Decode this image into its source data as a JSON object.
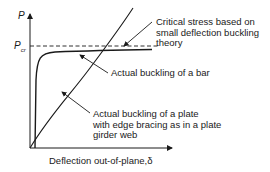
{
  "axes": {
    "y_label": "P",
    "y_marker_main": "P",
    "y_marker_sub": "cr",
    "x_label": "Deflection out-of-plane,δ"
  },
  "annotations": {
    "critical": [
      "Critical stress based on",
      "small deflection buckling",
      "theory"
    ],
    "bar": "Actual buckling of a bar",
    "plate": [
      "Actual buckling of a plate",
      "with edge bracing as in a plate",
      "girder web"
    ]
  },
  "colors": {
    "ink": "#1a1a1a",
    "background": "#ffffff"
  }
}
